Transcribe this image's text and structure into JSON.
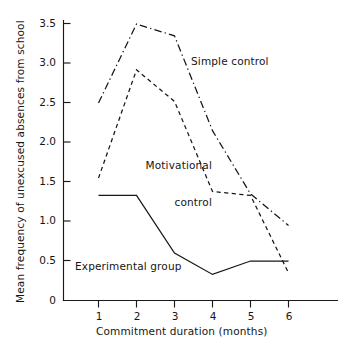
{
  "chart_data": {
    "type": "line",
    "title": "",
    "subtitle": "",
    "xlabel": "Commitment duration (months)",
    "ylabel": "Mean frequency of unexcused absences from school",
    "x": [
      1,
      2,
      3,
      4,
      5,
      6
    ],
    "xtick_labels": [
      "1",
      "2",
      "3",
      "4",
      "5",
      "6"
    ],
    "ytick_labels": [
      "0",
      "0.5",
      "1.0",
      "1.5",
      "2.0",
      "2.5",
      "3.0",
      "3.5"
    ],
    "ytick_values": [
      0,
      0.5,
      1.0,
      1.5,
      2.0,
      2.5,
      3.0,
      3.5
    ],
    "xlim": [
      0.6,
      6.0
    ],
    "ylim": [
      0,
      3.5
    ],
    "grid": false,
    "legend": "inline-annotations",
    "series": [
      {
        "name": "Simple control",
        "style": "dash-dot",
        "values": [
          2.5,
          3.5,
          3.35,
          2.15,
          1.35,
          0.95
        ]
      },
      {
        "name": "Motivational control",
        "style": "dashed",
        "values": [
          1.55,
          2.92,
          2.52,
          1.38,
          1.33,
          0.35
        ]
      },
      {
        "name": "Experimental group",
        "style": "solid",
        "values": [
          1.33,
          1.33,
          0.6,
          0.33,
          0.5,
          0.5
        ]
      }
    ],
    "annotations": [
      {
        "text": "Simple control",
        "series": "Simple control"
      },
      {
        "text": "Motivational\ncontrol",
        "series": "Motivational control"
      },
      {
        "text": "Experimental group",
        "series": "Experimental group"
      }
    ],
    "colors": {
      "axis": "#1a1a1a",
      "line": "#161616",
      "background": "#ffffff"
    }
  },
  "axes": {
    "y_title": "Mean frequency of unexcused absences from school",
    "x_title": "Commitment duration (months)",
    "y_ticks": [
      "3.5",
      "3.0",
      "2.5",
      "2.0",
      "1.5",
      "1.0",
      "0.5",
      "0"
    ],
    "x_ticks": [
      "1",
      "2",
      "3",
      "4",
      "5",
      "6"
    ]
  },
  "labels": {
    "simple_control": "Simple control",
    "motivational_control_line1": "Motivational",
    "motivational_control_line2": "control",
    "experimental_group": "Experimental group"
  }
}
